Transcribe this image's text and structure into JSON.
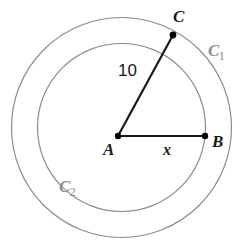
{
  "figure": {
    "background_color": "#ffffff",
    "width": 246,
    "height": 248
  },
  "geometry": {
    "center": {
      "x": 121.5,
      "y": 127.5
    },
    "circles": [
      {
        "id": "outer-circle",
        "name": "C1",
        "radius": 110,
        "stroke": "#8c8c8c",
        "stroke_width": 1.2
      },
      {
        "id": "inner-circle",
        "name": "C2",
        "radius": 84,
        "stroke": "#8c8c8c",
        "stroke_width": 1.2
      }
    ],
    "points": [
      {
        "id": "A",
        "label": "A",
        "x": 118,
        "y": 136,
        "marker": "filled-dot",
        "radius": 3.2
      },
      {
        "id": "B",
        "label": "B",
        "x": 205,
        "y": 136,
        "marker": "filled-dot",
        "radius": 3.2
      },
      {
        "id": "C",
        "label": "C",
        "x": 173,
        "y": 35,
        "marker": "filled-dot",
        "radius": 3.4
      }
    ],
    "segments": [
      {
        "id": "segment-AC",
        "from": "A",
        "to": "C",
        "label": "10",
        "stroke": "#1a1a1a",
        "stroke_width": 2.2
      },
      {
        "id": "segment-AB",
        "from": "A",
        "to": "B",
        "label": "x",
        "stroke": "#1a1a1a",
        "stroke_width": 2.2
      }
    ]
  },
  "labels": {
    "point_A": "A",
    "point_B": "B",
    "point_C": "C",
    "segment_AC_length": "10",
    "segment_AB_length": "x",
    "circle_outer_name": "C",
    "circle_outer_subscript": "1",
    "circle_inner_name": "C",
    "circle_inner_subscript": "2"
  },
  "colors": {
    "circle_stroke": "#8c8c8c",
    "segment_stroke": "#1a1a1a",
    "point_fill": "#000000",
    "text": "#1a1a1a",
    "circle_label_text": "#8c8c8c",
    "background": "#ffffff"
  }
}
